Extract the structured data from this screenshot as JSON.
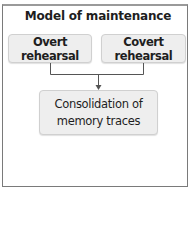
{
  "diagram": {
    "title": "Model of maintenance",
    "nodes": [
      {
        "id": "overt",
        "label": "Overt rehearsal"
      },
      {
        "id": "covert",
        "label": "Covert rehearsal"
      },
      {
        "id": "consolidation",
        "label_line1": "Consolidation of",
        "label_line2": "memory traces"
      }
    ],
    "edges": [
      {
        "from": "overt",
        "to": "consolidation"
      },
      {
        "from": "covert",
        "to": "consolidation"
      }
    ],
    "colors": {
      "box_fill": "#eeeeee",
      "box_border": "#d0d0d0",
      "line": "#555555",
      "frame": "#7a7a7a"
    }
  }
}
